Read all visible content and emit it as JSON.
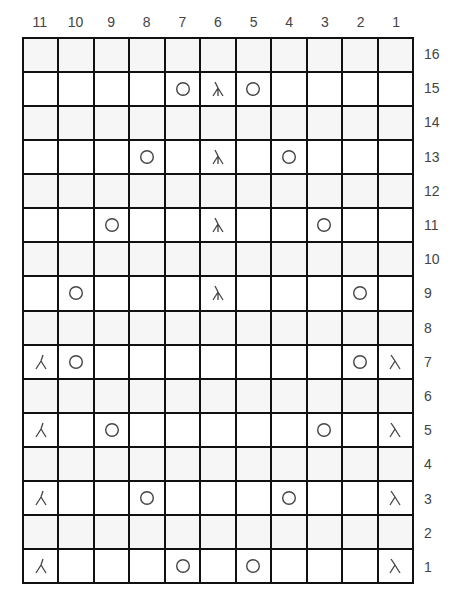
{
  "chart": {
    "columns": [
      "11",
      "10",
      "9",
      "8",
      "7",
      "6",
      "5",
      "4",
      "3",
      "2",
      "1"
    ],
    "rows_top_to_bottom": [
      "16",
      "15",
      "14",
      "13",
      "12",
      "11",
      "10",
      "9",
      "8",
      "7",
      "6",
      "5",
      "4",
      "3",
      "2",
      "1"
    ],
    "colors": {
      "grid_line": "#111111",
      "cell_odd": "#ffffff",
      "cell_even": "#f6f6f6",
      "symbol": "#444444",
      "label": "#444444"
    },
    "legend_symbols": {
      "yo": "yarn-over-icon",
      "cdd": "centered-double-decrease-icon",
      "ssk": "left-leaning-decrease-icon",
      "k2tog": "right-leaning-decrease-icon"
    },
    "grid": [
      [
        "",
        "",
        "",
        "",
        "",
        "",
        "",
        "",
        "",
        "",
        ""
      ],
      [
        "",
        "",
        "",
        "",
        "yo",
        "cdd",
        "yo",
        "",
        "",
        "",
        ""
      ],
      [
        "",
        "",
        "",
        "",
        "",
        "",
        "",
        "",
        "",
        "",
        ""
      ],
      [
        "",
        "",
        "",
        "yo",
        "",
        "cdd",
        "",
        "yo",
        "",
        "",
        ""
      ],
      [
        "",
        "",
        "",
        "",
        "",
        "",
        "",
        "",
        "",
        "",
        ""
      ],
      [
        "",
        "",
        "yo",
        "",
        "",
        "cdd",
        "",
        "",
        "yo",
        "",
        ""
      ],
      [
        "",
        "",
        "",
        "",
        "",
        "",
        "",
        "",
        "",
        "",
        ""
      ],
      [
        "",
        "yo",
        "",
        "",
        "",
        "cdd",
        "",
        "",
        "",
        "yo",
        ""
      ],
      [
        "",
        "",
        "",
        "",
        "",
        "",
        "",
        "",
        "",
        "",
        ""
      ],
      [
        "ssk",
        "yo",
        "",
        "",
        "",
        "",
        "",
        "",
        "",
        "yo",
        "k2tog"
      ],
      [
        "",
        "",
        "",
        "",
        "",
        "",
        "",
        "",
        "",
        "",
        ""
      ],
      [
        "ssk",
        "",
        "yo",
        "",
        "",
        "",
        "",
        "",
        "yo",
        "",
        "k2tog"
      ],
      [
        "",
        "",
        "",
        "",
        "",
        "",
        "",
        "",
        "",
        "",
        ""
      ],
      [
        "ssk",
        "",
        "",
        "yo",
        "",
        "",
        "",
        "yo",
        "",
        "",
        "k2tog"
      ],
      [
        "",
        "",
        "",
        "",
        "",
        "",
        "",
        "",
        "",
        "",
        ""
      ],
      [
        "ssk",
        "",
        "",
        "",
        "yo",
        "",
        "yo",
        "",
        "",
        "",
        "k2tog"
      ]
    ]
  }
}
